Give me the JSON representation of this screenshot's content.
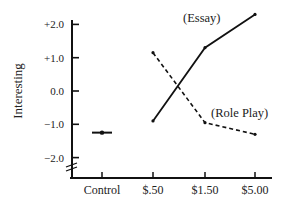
{
  "chart_data": {
    "type": "line",
    "title": "",
    "xlabel": "",
    "ylabel": "Interesting",
    "ylim": [
      -2.5,
      2.5
    ],
    "grid": false,
    "legend_position": "inline labels",
    "y_ticks": [
      "+2.0",
      "+1.0",
      "0.0",
      "−1.0",
      "−2.0"
    ],
    "y_tick_values": [
      2.0,
      1.0,
      0.0,
      -1.0,
      -2.0
    ],
    "categories": [
      "Control",
      "$.50",
      "$1.50",
      "$5.00"
    ],
    "series": [
      {
        "name": "Control",
        "style": "point",
        "values": [
          -1.25,
          null,
          null,
          null
        ]
      },
      {
        "name": "(Essay)",
        "style": "solid",
        "values": [
          null,
          -0.9,
          1.3,
          2.3
        ]
      },
      {
        "name": "(Role Play)",
        "style": "dashed",
        "values": [
          null,
          1.15,
          -0.95,
          -1.3
        ]
      }
    ],
    "annotations": [
      "(Essay)",
      "(Role Play)",
      "axis break marks near y-axis origin"
    ]
  }
}
